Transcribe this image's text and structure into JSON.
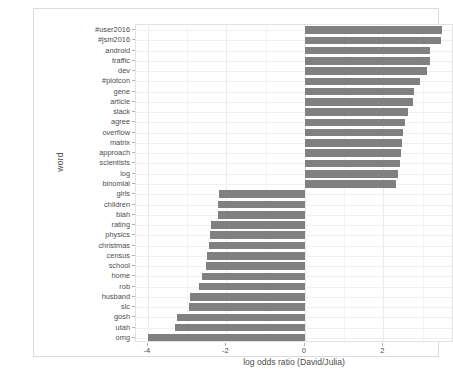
{
  "chart_data": {
    "type": "bar",
    "orientation": "horizontal",
    "title": "",
    "xlabel": "log odds ratio (David/Julia)",
    "ylabel": "word",
    "xlim": [
      -4.3,
      3.8
    ],
    "xticks": [
      -4,
      -2,
      0,
      2
    ],
    "xtick_labels": [
      "-4",
      "-2",
      "0",
      "2"
    ],
    "grid": true,
    "legend": "none",
    "bar_color": "#808080",
    "panel_background": "#ffffff",
    "categories": [
      "#user2016",
      "#jsm2016",
      "android",
      "traffic",
      "dev",
      "#plotcon",
      "gene",
      "article",
      "slack",
      "agree",
      "overflow",
      "matrix",
      "approach",
      "scientists",
      "log",
      "binomial",
      "girls",
      "children",
      "blah",
      "rating",
      "physics",
      "christmas",
      "census",
      "school",
      "home",
      "rob",
      "husband",
      "slc",
      "gosh",
      "utah",
      "omg"
    ],
    "values": [
      3.5,
      3.47,
      3.2,
      3.18,
      3.1,
      2.93,
      2.78,
      2.75,
      2.62,
      2.55,
      2.5,
      2.48,
      2.45,
      2.42,
      2.38,
      2.32,
      -2.18,
      -2.2,
      -2.22,
      -2.4,
      -2.42,
      -2.45,
      -2.48,
      -2.52,
      -2.62,
      -2.7,
      -2.92,
      -2.95,
      -3.25,
      -3.3,
      -4.0
    ]
  },
  "axis": {
    "y_title": "word",
    "x_title": "log odds ratio (David/Julia)"
  },
  "caption": ""
}
